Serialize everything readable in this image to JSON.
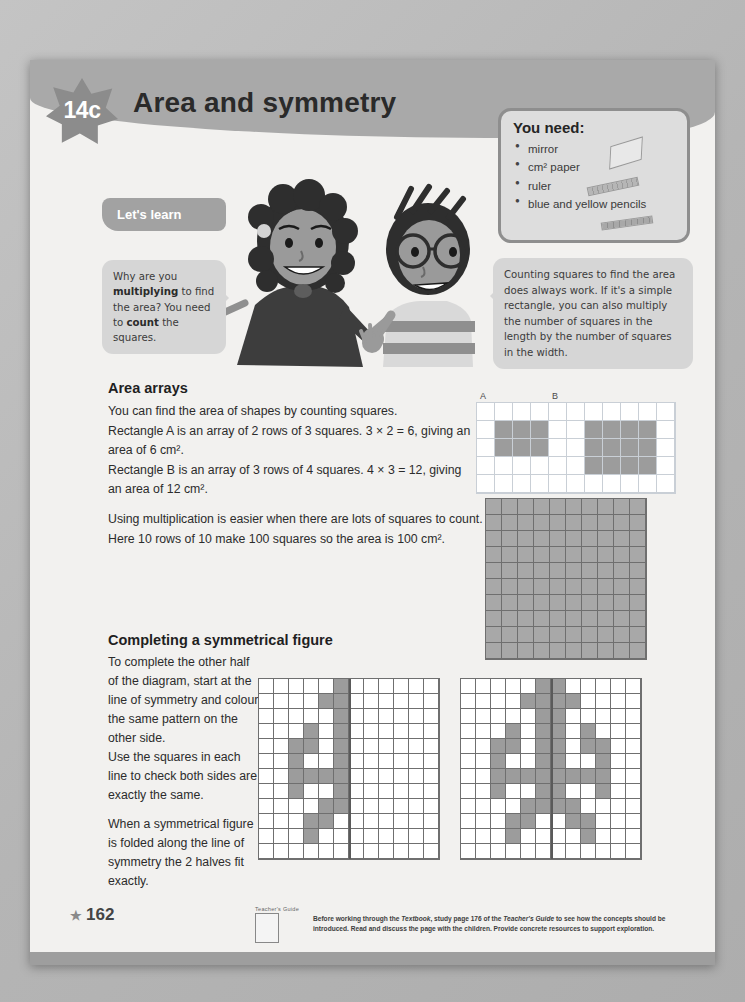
{
  "page": {
    "unit_code": "14c",
    "title": "Area and symmetry",
    "page_number": "162",
    "star_glyph": "★"
  },
  "you_need": {
    "heading": "You need:",
    "items": [
      "mirror",
      "cm² paper",
      "ruler",
      "blue and yellow pencils"
    ]
  },
  "lets_learn": {
    "label": "Let's learn"
  },
  "bubbles": {
    "left": {
      "part1": "Why are you ",
      "bold1": "multiplying",
      "part2": " to find the area? You need to ",
      "bold2": "count",
      "part3": " the squares."
    },
    "right": {
      "text": "Counting squares to find the area does always work. If it's a simple rectangle, you can also multiply the number of squares in the length by the number of squares in the width."
    }
  },
  "area_arrays": {
    "heading": "Area arrays",
    "line1": "You can find the area of shapes by counting squares.",
    "line2": "Rectangle A is an array of 2 rows of 3 squares. 3 × 2 = 6, giving an area of 6 cm².",
    "line3": "Rectangle B is an array of 3 rows of 4 squares. 4 × 3 = 12, giving an area of 12 cm².",
    "line4": "Using multiplication is easier when there are lots of squares to count.",
    "line5": "Here 10 rows of 10 make 100 squares so the area is 100 cm².",
    "label_a": "A",
    "label_b": "B"
  },
  "symmetry": {
    "heading": "Completing a symmetrical figure",
    "para1": "To complete the other half of the diagram, start at the line of symmetry and colour the same pattern on the other side.",
    "para2": "Use the squares in each line to check both sides are exactly the same.",
    "para3": "When a symmetrical figure is folded along the line of symmetry the 2 halves fit exactly."
  },
  "footer": {
    "tg_label": "Teacher's Guide",
    "text_a": "Before working through the ",
    "text_b": "Textbook",
    "text_c": ", study page 176 of the ",
    "text_d": "Teacher's Guide",
    "text_e": " to see how the concepts should be introduced. Read and discuss the page with the children. Provide concrete resources to support exploration."
  },
  "colors": {
    "band": "#a9a9a9",
    "fill": "#9c9c9c",
    "paper": "#f2f1ef",
    "bubble": "#d6d6d6"
  },
  "chart_data": {
    "type": "table",
    "grids": [
      {
        "name": "rect-ab-grid",
        "cols": 11,
        "rows": 5,
        "shapes": [
          {
            "label": "A",
            "col": 1,
            "row": 1,
            "w": 3,
            "h": 2,
            "area": 6,
            "expression": "3 × 2 = 6"
          },
          {
            "label": "B",
            "col": 6,
            "row": 1,
            "w": 4,
            "h": 3,
            "area": 12,
            "expression": "4 × 3 = 12"
          }
        ]
      },
      {
        "name": "hundred-square",
        "cols": 10,
        "rows": 10,
        "all_filled": true,
        "area": 100,
        "expression": "10 × 10 = 100"
      },
      {
        "name": "symmetry-grid-left",
        "cols": 12,
        "rows": 12,
        "symmetry_line_after_col": 6,
        "filled": [
          [
            5
          ],
          [
            4,
            5
          ],
          [
            5
          ],
          [
            3,
            5
          ],
          [
            2,
            3,
            5
          ],
          [
            2,
            5
          ],
          [
            2,
            3,
            4,
            5
          ],
          [
            2,
            5
          ],
          [
            4,
            5
          ],
          [
            3,
            4
          ],
          [
            3
          ],
          []
        ]
      },
      {
        "name": "symmetry-grid-right",
        "cols": 12,
        "rows": 12,
        "symmetry_line_after_col": 6,
        "filled": [
          [
            5,
            6
          ],
          [
            4,
            5,
            6,
            7
          ],
          [
            5,
            6
          ],
          [
            3,
            5,
            6,
            8
          ],
          [
            2,
            3,
            5,
            6,
            8,
            9
          ],
          [
            2,
            5,
            6,
            9
          ],
          [
            2,
            3,
            4,
            5,
            6,
            7,
            8,
            9
          ],
          [
            2,
            5,
            6,
            9
          ],
          [
            4,
            5,
            6,
            7
          ],
          [
            3,
            4,
            7,
            8
          ],
          [
            3,
            8
          ],
          []
        ]
      }
    ]
  }
}
